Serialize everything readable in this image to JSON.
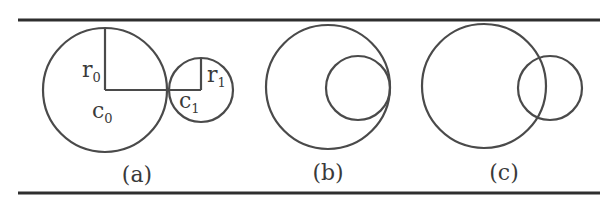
{
  "figure": {
    "panels": [
      {
        "id": "a",
        "caption": "(a)",
        "big_circle": {
          "cx": 105,
          "cy": 90,
          "r": 62
        },
        "small_circle": {
          "cx": 201,
          "cy": 90,
          "r": 32
        },
        "labels": {
          "r0": {
            "base": "r",
            "sub": "0"
          },
          "c0": {
            "base": "c",
            "sub": "0"
          },
          "r1": {
            "base": "r",
            "sub": "1"
          },
          "c1": {
            "base": "c",
            "sub": "1"
          }
        }
      },
      {
        "id": "b",
        "caption": "(b)",
        "big_circle": {
          "cx": 328,
          "cy": 87,
          "r": 62
        },
        "small_circle": {
          "cx": 358,
          "cy": 88,
          "r": 32
        }
      },
      {
        "id": "c",
        "caption": "(c)",
        "big_circle": {
          "cx": 484,
          "cy": 86,
          "r": 62
        },
        "small_circle": {
          "cx": 550,
          "cy": 88,
          "r": 32
        }
      }
    ],
    "colors": {
      "stroke": "#4a4a4a",
      "rule": "#2e2e2e",
      "background": "#ffffff"
    }
  }
}
